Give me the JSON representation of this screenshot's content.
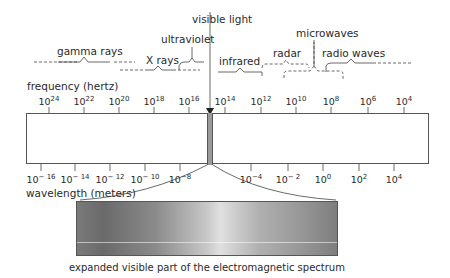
{
  "title_pointer": "visible light",
  "bands": {
    "gamma": "gamma rays",
    "xray": "X rays",
    "uv": "ultraviolet",
    "infrared": "infrared",
    "microwaves": "microwaves",
    "radar": "radar",
    "radio": "radio waves"
  },
  "frequency": {
    "label": "frequency (hertz)",
    "ticks": [
      {
        "base": "10",
        "exp": "24"
      },
      {
        "base": "10",
        "exp": "22"
      },
      {
        "base": "10",
        "exp": "20"
      },
      {
        "base": "10",
        "exp": "18"
      },
      {
        "base": "10",
        "exp": "16"
      },
      {
        "base": "10",
        "exp": "14"
      },
      {
        "base": "10",
        "exp": "12"
      },
      {
        "base": "10",
        "exp": "10"
      },
      {
        "base": "10",
        "exp": "8"
      },
      {
        "base": "10",
        "exp": "6"
      },
      {
        "base": "10",
        "exp": "4"
      }
    ]
  },
  "wavelength": {
    "label": "wavelength (meters)",
    "ticks": [
      {
        "base": "10",
        "exp": "− 16"
      },
      {
        "base": "10",
        "exp": "− 14"
      },
      {
        "base": "10",
        "exp": "− 12"
      },
      {
        "base": "10",
        "exp": "− 10"
      },
      {
        "base": "10",
        "exp": "−8"
      },
      {
        "base": "10",
        "exp": "−4"
      },
      {
        "base": "10",
        "exp": "− 2"
      },
      {
        "base": "10",
        "exp": "0"
      },
      {
        "base": "10",
        "exp": "2"
      },
      {
        "base": "10",
        "exp": "4"
      }
    ]
  },
  "caption": "expanded visible part of the electromagnetic spectrum"
}
